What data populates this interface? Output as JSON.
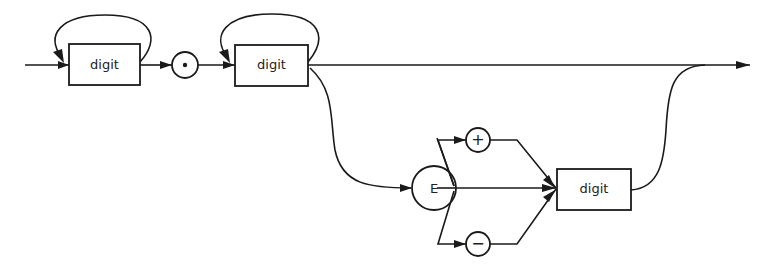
{
  "diagram": {
    "type": "syntax-diagram",
    "nodes": {
      "digit_integer": {
        "label": "digit",
        "kind": "nonterminal"
      },
      "decimal_point": {
        "label": "·",
        "kind": "terminal"
      },
      "digit_fraction": {
        "label": "digit",
        "kind": "nonterminal"
      },
      "exponent_marker": {
        "label": "E",
        "kind": "terminal"
      },
      "plus_sign": {
        "label": "+",
        "kind": "terminal"
      },
      "minus_sign": {
        "label": "−",
        "kind": "terminal"
      },
      "digit_exponent": {
        "label": "digit",
        "kind": "nonterminal"
      }
    },
    "edges": [
      [
        "entry",
        "digit_integer"
      ],
      [
        "digit_integer",
        "digit_integer",
        "loop"
      ],
      [
        "digit_integer",
        "decimal_point"
      ],
      [
        "decimal_point",
        "digit_fraction"
      ],
      [
        "digit_fraction",
        "digit_fraction",
        "loop"
      ],
      [
        "digit_fraction",
        "exit"
      ],
      [
        "digit_fraction",
        "exponent_marker"
      ],
      [
        "exponent_marker",
        "plus_sign"
      ],
      [
        "exponent_marker",
        "minus_sign"
      ],
      [
        "exponent_marker",
        "digit_exponent"
      ],
      [
        "plus_sign",
        "digit_exponent"
      ],
      [
        "minus_sign",
        "digit_exponent"
      ],
      [
        "digit_exponent",
        "exit"
      ]
    ],
    "colors": {
      "stroke": "#1a1a1a",
      "background": "#ffffff"
    }
  }
}
